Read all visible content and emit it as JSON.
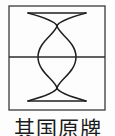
{
  "figure": {
    "label": "geometric-diagram",
    "frame": {
      "shape": "square",
      "x": 9,
      "y": 6,
      "width": 96,
      "height": 104,
      "stroke_color": "#3a3a3a",
      "stroke_width": 1.3,
      "fill_color": "#fdfdfd"
    },
    "horizontal_axis": {
      "name": "midline",
      "y": 57,
      "x_start": 9,
      "x_end": 105,
      "stroke_color": "#2b2b2b",
      "stroke_width": 1.6
    },
    "curves": [
      {
        "name": "left-to-right-arc",
        "start": [
          28,
          13
        ],
        "end": [
          86,
          101
        ],
        "stroke_color": "#1f1f1f",
        "stroke_width": 1.5
      },
      {
        "name": "right-to-left-arc",
        "start": [
          86,
          13
        ],
        "end": [
          28,
          101
        ],
        "stroke_color": "#1f1f1f",
        "stroke_width": 1.5
      }
    ],
    "chords": [
      {
        "name": "top-chord",
        "start": [
          28,
          13
        ],
        "end": [
          86,
          13
        ],
        "stroke_color": "#1f1f1f",
        "stroke_width": 1.5
      },
      {
        "name": "bottom-chord",
        "start": [
          28,
          101
        ],
        "end": [
          86,
          101
        ],
        "stroke_color": "#1f1f1f",
        "stroke_width": 1.5
      }
    ],
    "crossings": [
      {
        "name": "upper-crossing",
        "x": 57,
        "y": 26
      },
      {
        "name": "lower-crossing",
        "x": 57,
        "y": 88
      }
    ],
    "lens": {
      "name": "central-vesica",
      "top": [
        57,
        26
      ],
      "bottom": [
        57,
        88
      ],
      "left_extent": 38,
      "right_extent": 76
    }
  },
  "caption": {
    "text": "其国原牌",
    "characters": [
      "其",
      "国",
      "原",
      "牌"
    ],
    "color": "#1b1b1b",
    "clipped": true
  },
  "page": {
    "background_color": "#fdfdfd",
    "width": 115,
    "height": 136
  }
}
